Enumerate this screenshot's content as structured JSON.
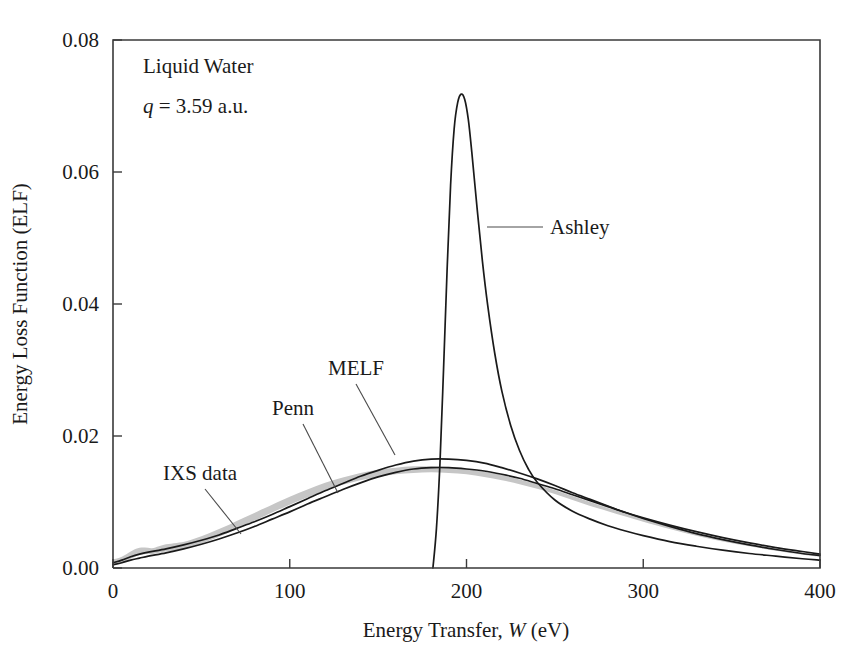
{
  "figure": {
    "background": "#ffffff",
    "frame_color": "#3a3a3a"
  },
  "annotations": {
    "sample_label": "Liquid Water",
    "momentum_symbol": "q",
    "momentum_rest": " = 3.59 a.u.",
    "momentum_full": "q = 3.59 a.u."
  },
  "labels": {
    "ixs": "IXS data",
    "penn": "Penn",
    "melf": "MELF",
    "ashley": "Ashley"
  },
  "axes": {
    "x_title_main": "Energy Transfer, ",
    "x_title_symbol": "W",
    "x_title_unit": " (eV)",
    "y_title": "Energy Loss Function (ELF)",
    "x_ticks": [
      "0",
      "100",
      "200",
      "300",
      "400"
    ],
    "y_ticks": [
      "0.00",
      "0.02",
      "0.04",
      "0.06",
      "0.08"
    ]
  },
  "chart_data": {
    "type": "line",
    "title": "",
    "subtitle": "Liquid Water, q = 3.59 a.u.",
    "xlabel": "Energy Transfer, W (eV)",
    "ylabel": "Energy Loss Function (ELF)",
    "xlim": [
      0,
      400
    ],
    "ylim": [
      0,
      0.08
    ],
    "xticks": [
      0,
      100,
      200,
      300,
      400
    ],
    "yticks": [
      0,
      0.02,
      0.04,
      0.06,
      0.08
    ],
    "grid": false,
    "legend": "inline-annotations",
    "annotations": [
      {
        "text": "Liquid Water",
        "x": 30,
        "y": 0.0735
      },
      {
        "text": "q = 3.59 a.u.",
        "x": 30,
        "y": 0.0685
      },
      {
        "text": "IXS data",
        "x": 42,
        "y": 0.0152,
        "points_to": {
          "x": 72,
          "y": 0.0052
        }
      },
      {
        "text": "Penn",
        "x": 104,
        "y": 0.0238,
        "points_to": {
          "x": 139,
          "y": 0.011
        }
      },
      {
        "text": "MELF",
        "x": 148,
        "y": 0.029,
        "points_to": {
          "x": 180,
          "y": 0.015
        }
      },
      {
        "text": "Ashley",
        "x": 250,
        "y": 0.05,
        "points_to": {
          "x": 208,
          "y": 0.05
        }
      }
    ],
    "series": [
      {
        "name": "IXS data",
        "style": "shaded-band",
        "color": "#c6c6c6",
        "x": [
          0,
          5,
          10,
          14,
          18,
          22,
          26,
          30,
          36,
          42,
          50,
          58,
          66,
          74,
          82,
          90,
          100,
          110,
          120,
          130,
          140,
          150,
          160,
          170,
          180,
          190,
          200,
          210,
          220,
          230,
          240,
          250,
          260,
          270,
          280,
          290,
          300,
          315,
          330,
          345,
          360,
          375,
          390,
          400
        ],
        "upper": [
          0.0013,
          0.0017,
          0.0025,
          0.003,
          0.0031,
          0.003,
          0.0033,
          0.0036,
          0.0038,
          0.0041,
          0.0048,
          0.0057,
          0.0066,
          0.0076,
          0.0086,
          0.0096,
          0.0108,
          0.0119,
          0.0129,
          0.0137,
          0.0144,
          0.0149,
          0.0152,
          0.0154,
          0.0154,
          0.0153,
          0.015,
          0.0146,
          0.0141,
          0.0134,
          0.0127,
          0.0118,
          0.0109,
          0.01,
          0.0091,
          0.0083,
          0.0075,
          0.0063,
          0.0053,
          0.0044,
          0.0036,
          0.0029,
          0.0023,
          0.002
        ],
        "lower": [
          0.0004,
          0.0008,
          0.0014,
          0.0019,
          0.0021,
          0.0021,
          0.0023,
          0.0025,
          0.0027,
          0.003,
          0.0037,
          0.0045,
          0.0054,
          0.0064,
          0.0074,
          0.0084,
          0.0096,
          0.0107,
          0.0117,
          0.0126,
          0.0133,
          0.0138,
          0.0142,
          0.0144,
          0.0145,
          0.0144,
          0.0142,
          0.0138,
          0.0133,
          0.0127,
          0.012,
          0.0112,
          0.0103,
          0.0094,
          0.0086,
          0.0078,
          0.007,
          0.0059,
          0.0049,
          0.004,
          0.0033,
          0.0026,
          0.002,
          0.0017
        ]
      },
      {
        "name": "MELF",
        "style": "solid",
        "color": "#1a1a1a",
        "x": [
          0,
          5,
          10,
          15,
          20,
          30,
          40,
          50,
          60,
          70,
          80,
          90,
          100,
          110,
          120,
          130,
          140,
          150,
          160,
          170,
          180,
          190,
          200,
          210,
          220,
          230,
          240,
          250,
          260,
          270,
          280,
          290,
          300,
          315,
          330,
          345,
          360,
          375,
          390,
          400
        ],
        "y": [
          0.0008,
          0.0012,
          0.0017,
          0.0021,
          0.0024,
          0.0029,
          0.0035,
          0.0042,
          0.005,
          0.006,
          0.007,
          0.0081,
          0.0093,
          0.0105,
          0.0117,
          0.0128,
          0.0139,
          0.0148,
          0.0156,
          0.0162,
          0.0165,
          0.0165,
          0.0163,
          0.0159,
          0.0152,
          0.0144,
          0.0135,
          0.0125,
          0.0114,
          0.0104,
          0.0094,
          0.0084,
          0.0075,
          0.0063,
          0.0052,
          0.0043,
          0.0035,
          0.0028,
          0.0022,
          0.0019
        ]
      },
      {
        "name": "Penn",
        "style": "solid",
        "color": "#1a1a1a",
        "x": [
          0,
          5,
          10,
          15,
          20,
          30,
          40,
          50,
          60,
          70,
          80,
          90,
          100,
          110,
          120,
          130,
          140,
          150,
          160,
          170,
          180,
          190,
          200,
          210,
          220,
          230,
          240,
          250,
          260,
          270,
          280,
          290,
          300,
          315,
          330,
          345,
          360,
          375,
          390,
          400
        ],
        "y": [
          0.0005,
          0.0008,
          0.0012,
          0.0015,
          0.0018,
          0.0023,
          0.0029,
          0.0036,
          0.0044,
          0.0053,
          0.0063,
          0.0074,
          0.0085,
          0.0097,
          0.0108,
          0.0119,
          0.0129,
          0.0138,
          0.0145,
          0.015,
          0.0152,
          0.0152,
          0.015,
          0.0147,
          0.0142,
          0.0136,
          0.0128,
          0.012,
          0.0111,
          0.0102,
          0.0093,
          0.0084,
          0.0076,
          0.0065,
          0.0055,
          0.0046,
          0.0038,
          0.0031,
          0.0025,
          0.0021
        ]
      },
      {
        "name": "Ashley",
        "style": "solid",
        "color": "#1a1a1a",
        "x": [
          181,
          183,
          185,
          187,
          189,
          191,
          193,
          195,
          197,
          199,
          201,
          203,
          206,
          209,
          212,
          216,
          220,
          225,
          230,
          235,
          240,
          250,
          260,
          270,
          280,
          290,
          300,
          315,
          330,
          345,
          360,
          375,
          390,
          400
        ],
        "y": [
          0.0,
          0.006,
          0.016,
          0.03,
          0.045,
          0.058,
          0.0665,
          0.0705,
          0.0718,
          0.071,
          0.068,
          0.063,
          0.0545,
          0.0465,
          0.0398,
          0.0325,
          0.0268,
          0.0216,
          0.0178,
          0.015,
          0.013,
          0.0103,
          0.0086,
          0.0074,
          0.0064,
          0.0056,
          0.0049,
          0.004,
          0.0033,
          0.0027,
          0.0022,
          0.0018,
          0.0014,
          0.0012
        ]
      }
    ]
  }
}
